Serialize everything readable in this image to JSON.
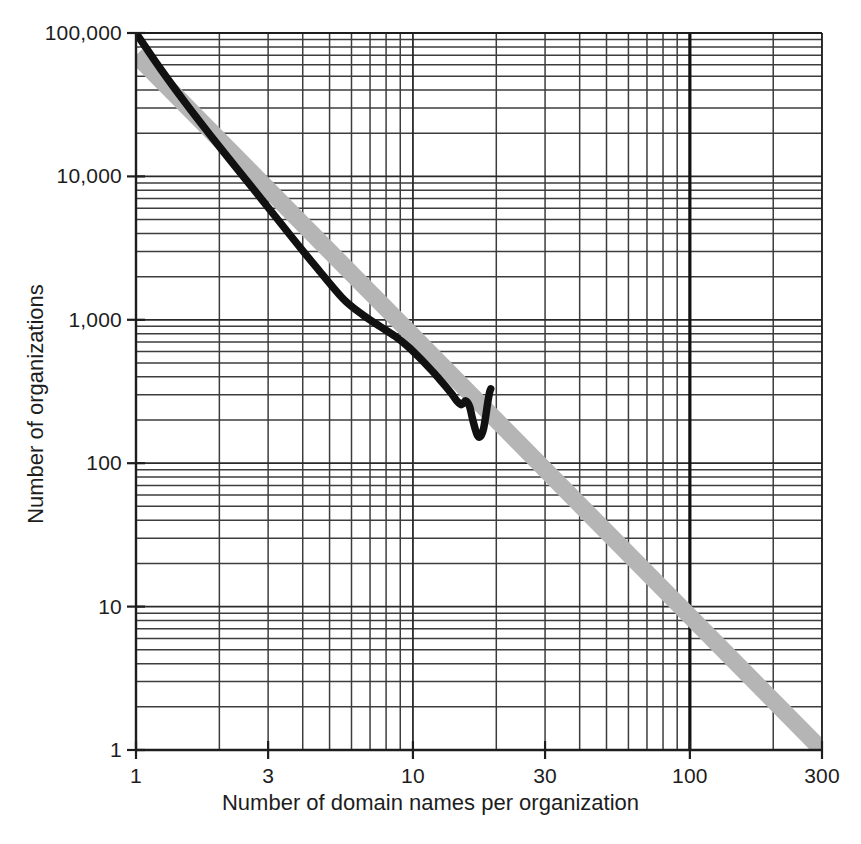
{
  "chart_data": {
    "type": "line",
    "title": "",
    "xlabel": "Number of domain names per organization",
    "ylabel": "Number of organizations",
    "xscale": "log",
    "yscale": "log",
    "xlim": [
      1,
      300
    ],
    "ylim": [
      1,
      100000
    ],
    "grid": true,
    "grid_minor": true,
    "legend": "none",
    "xticks": [
      {
        "value": 1,
        "label": "1"
      },
      {
        "value": 3,
        "label": "3"
      },
      {
        "value": 10,
        "label": "10"
      },
      {
        "value": 30,
        "label": "30"
      },
      {
        "value": 100,
        "label": "100"
      },
      {
        "value": 300,
        "label": "300"
      }
    ],
    "yticks": [
      {
        "value": 1,
        "label": "1"
      },
      {
        "value": 10,
        "label": "10"
      },
      {
        "value": 100,
        "label": "100"
      },
      {
        "value": 1000,
        "label": "1,000"
      },
      {
        "value": 10000,
        "label": "10,000"
      },
      {
        "value": 100000,
        "label": "100,000"
      }
    ],
    "series": [
      {
        "name": "power-law reference band",
        "style": "thick grey band",
        "color": "#b3b3b3",
        "band_width_px": 17,
        "x": [
          1,
          300
        ],
        "y": [
          70000,
          1.0
        ]
      },
      {
        "name": "observed distribution",
        "style": "thick black curve",
        "color": "#111111",
        "x": [
          1.0,
          1.22,
          1.5,
          1.85,
          2.3,
          2.9,
          3.6,
          4.5,
          5.6,
          6.6,
          7.6,
          8.6,
          9.6,
          10.6,
          11.6,
          12.4,
          13.1,
          13.8,
          14.4,
          15.0,
          15.5,
          16.0,
          16.4,
          16.8,
          17.1,
          17.4,
          17.7,
          18.0,
          18.3,
          18.6,
          18.9,
          19.1
        ],
        "y": [
          100000,
          57000,
          33000,
          19500,
          11500,
          6600,
          3900,
          2300,
          1400,
          1080,
          900,
          770,
          650,
          540,
          450,
          390,
          345,
          305,
          272,
          256,
          272,
          250,
          205,
          172,
          156,
          152,
          158,
          175,
          210,
          260,
          310,
          330
        ]
      }
    ]
  },
  "axis_titles": {
    "x": "Number of domain names per organization",
    "y": "Number of organizations"
  }
}
